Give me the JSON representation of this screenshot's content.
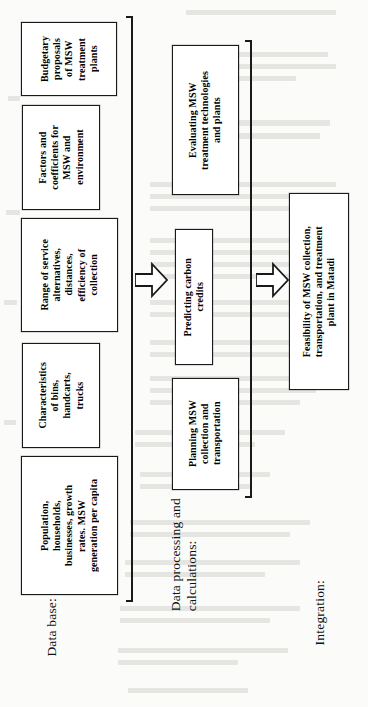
{
  "figure": {
    "type": "flowchart",
    "orientation": "rotated-90-ccw",
    "background_color": "#fbfbf9",
    "line_color": "#1a1a1a"
  },
  "groups": [
    {
      "id": "data-base",
      "label": "Data base:",
      "nodes": [
        {
          "id": "budgetary",
          "text": "Budgetary\nproposals\nof MSW\ntreatment\nplants"
        },
        {
          "id": "factors",
          "text": "Factors and\ncoefficients for\nMSW and\nenvironment"
        },
        {
          "id": "range-of-service",
          "text": "Range of service\nalternatives,\ndistances,\nefficiency of\ncollection"
        },
        {
          "id": "characteristics",
          "text": "Characteristics\nof bins,\nhandcarts,\ntrucks"
        },
        {
          "id": "population",
          "text": "Population,\nhouseholds,\nbusinesses, growth\nrates. MSW\ngeneration per capita"
        }
      ]
    },
    {
      "id": "data-processing",
      "label": "Data processing and\ncalculations:",
      "nodes": [
        {
          "id": "evaluating",
          "text": "Evaluating MSW\ntreatment technologies\nand plants"
        },
        {
          "id": "predicting",
          "text": "Predicting carbon\ncredits"
        },
        {
          "id": "planning",
          "text": "Planning  MSW\ncollection and\ntransportation"
        }
      ]
    },
    {
      "id": "integration",
      "label": "Integration:",
      "nodes": [
        {
          "id": "feasibility",
          "text": "Feasibility of MSW collection,\ntransportation, and treatment\nplant in Matadi"
        }
      ]
    }
  ],
  "arrows": [
    {
      "id": "arrow-database-to-processing",
      "direction": "right",
      "name": "block-arrow-icon"
    },
    {
      "id": "arrow-processing-to-integration",
      "direction": "right",
      "name": "block-arrow-icon"
    }
  ]
}
